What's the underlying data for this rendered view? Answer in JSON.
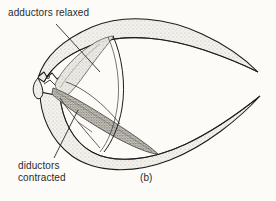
{
  "figure": {
    "caption": "(b)",
    "labels": {
      "adductors": "adductors relaxed",
      "diductors_line1": "diductors",
      "diductors_line2": "contracted"
    }
  },
  "colors": {
    "background": "#fcfbf8",
    "ink": "#1c1c1c",
    "text": "#2b2b2b",
    "shell_stipple": "#d9d6cf",
    "adductor_stipple": "#cfccc4",
    "diductor_stipple": "#8d8a82"
  },
  "diagram": {
    "parts": [
      "upper-valve",
      "lower-valve",
      "hinge",
      "adductor-muscle",
      "diductor-muscle"
    ]
  }
}
